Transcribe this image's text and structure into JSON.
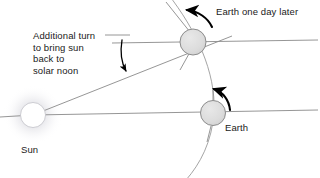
{
  "diagram": {
    "background_color": "#ffffff",
    "line_color": "#8a8a8a",
    "arrow_color": "#000000",
    "body_fill": "#dcdcdc",
    "body_stroke": "#8c8c8c",
    "sun_fill": "#ffffff",
    "text_color": "#1a1a1a"
  },
  "labels": {
    "annotation": "Additional turn\nto bring sun\nback to\nsolar noon",
    "earth_one_day_later": "Earth one day later",
    "earth": "Earth",
    "sun": "Sun"
  },
  "bodies": [
    {
      "name": "sun",
      "label": "Sun",
      "cx": 33,
      "cy": 115,
      "r": 12.5
    },
    {
      "name": "earth-one-day-later",
      "label": "Earth one day later",
      "cx": 193,
      "cy": 42,
      "r": 13
    },
    {
      "name": "earth",
      "label": "Earth",
      "cx": 213,
      "cy": 113,
      "r": 12.5
    }
  ],
  "annotations": {
    "angle_arrow": "curved arrow showing additional rotation angle",
    "rotation_arrows": [
      "counterclockwise rotation arrow at Earth one day later",
      "counterclockwise rotation arrow at Earth"
    ],
    "orbit_arc": "earth orbital path arc"
  }
}
